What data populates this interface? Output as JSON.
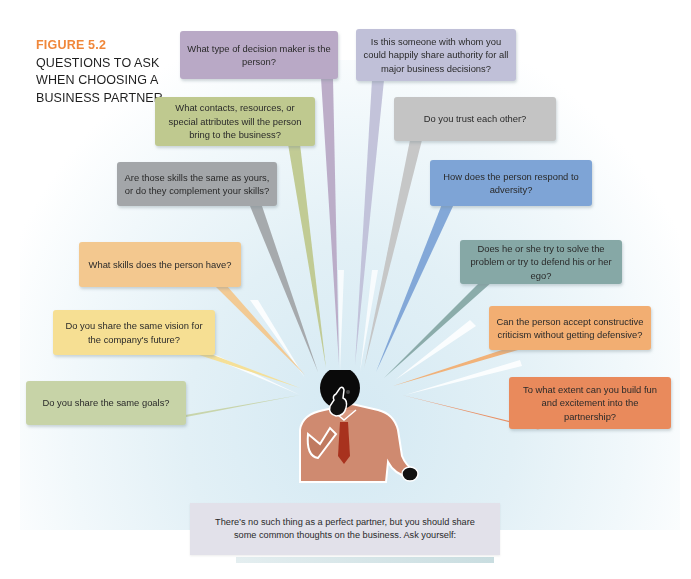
{
  "figure": {
    "number": "FIGURE 5.2",
    "title_lines": [
      "QUESTIONS TO ASK",
      "WHEN CHOOSING A",
      "BUSINESS PARTNER"
    ],
    "accent_color": "#f0873a"
  },
  "questions": [
    {
      "id": "decision-maker",
      "text": "What type of decision maker is the person?",
      "color": "#b9a9c6"
    },
    {
      "id": "share-authority",
      "text": "Is this someone with whom you could happily share authority for all major business decisions?",
      "color": "#c0c0d8"
    },
    {
      "id": "contacts-resources",
      "text": "What contacts, resources, or special attributes will the person bring to the business?",
      "color": "#bfc98f"
    },
    {
      "id": "trust",
      "text": "Do you trust each other?",
      "color": "#c4c4c4"
    },
    {
      "id": "skills-complement",
      "text": "Are those skills the same as yours, or do they complement your skills?",
      "color": "#a3a6a9"
    },
    {
      "id": "adversity",
      "text": "How does the person respond to adversity?",
      "color": "#7ea4d6"
    },
    {
      "id": "skills",
      "text": "What skills does the person have?",
      "color": "#f3c88f"
    },
    {
      "id": "solve-or-defend",
      "text": "Does he or she try to solve the problem or try to defend his or her ego?",
      "color": "#86a8a6"
    },
    {
      "id": "shared-vision",
      "text": "Do you share the same vision for the company's future?",
      "color": "#f6df93"
    },
    {
      "id": "constructive-criticism",
      "text": "Can the person accept constructive criticism without getting defensive?",
      "color": "#f2ae72"
    },
    {
      "id": "shared-goals",
      "text": "Do you share the same goals?",
      "color": "#c7d3a7"
    },
    {
      "id": "fun-excitement",
      "text": "To what extent can you build fun and excitement into the partnership?",
      "color": "#e98a5c"
    }
  ],
  "footer": {
    "text": "There’s no such thing as a perfect  partner, but you should share some common thoughts on the business.  Ask yourself:"
  },
  "illustration": {
    "subject": "thinking-person-icon",
    "shirt_color": "#cf8a70",
    "tie_color": "#a8321e",
    "head_color": "#0a0a0a"
  }
}
